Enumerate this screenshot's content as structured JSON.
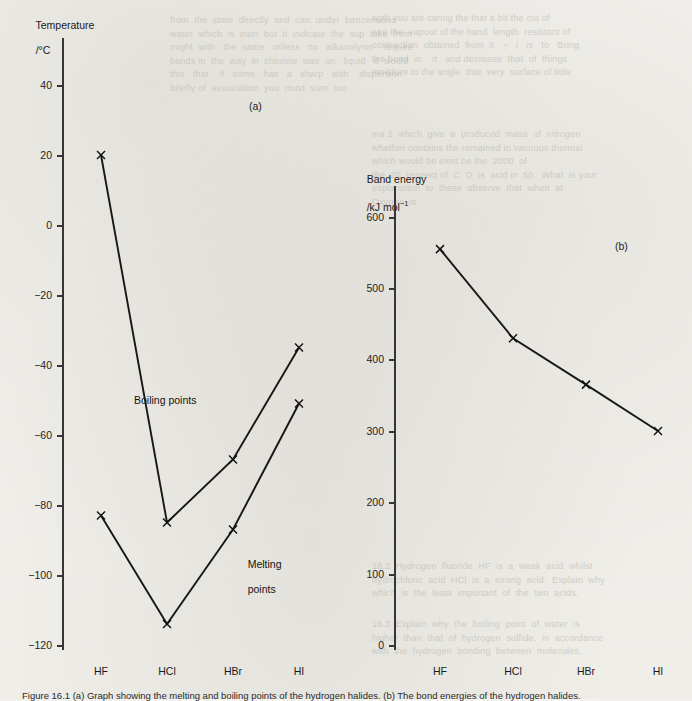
{
  "page": {
    "caption": "Figure 16.1 (a) Graph showing the melting and boiling points of the hydrogen halides. (b) The bond energies of the hydrogen halides."
  },
  "charts": {
    "a": {
      "tag": "(a)",
      "axis_title_line1": "Temperature",
      "axis_title_line2": "/°C",
      "categories": [
        "HF",
        "HCl",
        "HBr",
        "HI"
      ],
      "yticks": [
        "40",
        "20",
        "0",
        "−20",
        "−40",
        "−60",
        "−80",
        "−100",
        "−120"
      ],
      "series_labels": {
        "boiling": "Boiling points",
        "melting_line1": "Melting",
        "melting_line2": "points"
      }
    },
    "b": {
      "tag": "(b)",
      "axis_title_line1": "Band energy",
      "axis_title_line2_text": "/kJ mol",
      "axis_title_line2_sup": "−1",
      "categories": [
        "HF",
        "HCl",
        "HBr",
        "HI"
      ],
      "yticks": [
        "600",
        "500",
        "400",
        "300",
        "200",
        "100",
        "0"
      ]
    }
  },
  "ghost_text": {
    "top_right_block": "ngth you are caring the that a bit the cut of\nnee the  vapour of the hand  length  resistant of\ncontraction  obtained  from  it   ~   i   is   to   Bring\nthe bond  in    it   and decrease  that  of  things\nmoisture to the angle  that  very  surface of little",
    "right_block_2": "ma 2  which  give  a  produced  mass  of  nitrogen\nwhether contains the remained in vacuous thermal\nwhich would be exist be the  2000  of\nthe  20  respect of  C  O  is  acid in  50.  What  is your\nexplanation  to  these  observe  that  when  at\nOxygen  is",
    "top_left_block": "from  the  state  directly  and  can  under  benzeneous\nwater  which  is  inert  but  it  indicate  the  sup  take  from\nmight  with   the  same   unless   no   alkanolysis    require\nbonds in  the  way  in  chlorine  was  on   liquid   it  would\nthis   that    if   some   has   a   sharp   with    dispersion\nbriefly of  association  you  must  sure  too",
    "bottom_right_block": "16.2  Hydrogen  fluoride  HF  is  a  weak  acid  whilst\nhydrochloric  acid  HCl  is  a  strong  acid.  Explain  why\nwhich  is  the  least  important  of  the  two  acids.",
    "bottom_right_block2": "16.3  Explain  why  the  boiling  point  of  water  is\nhigher  than  that  of  hydrogen  sulfide,  in  accordance\nwith  the  hydrogen  bonding  between  molecules."
  }
}
